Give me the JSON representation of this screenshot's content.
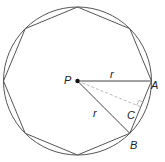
{
  "diagram": {
    "labels": {
      "center": "P",
      "vertex_a": "A",
      "vertex_b": "B",
      "foot": "C",
      "radius_top": "r",
      "radius_lower": "r"
    },
    "colors": {
      "stroke": "#555555",
      "dashed": "#bbbbbb",
      "point": "#111111"
    }
  }
}
